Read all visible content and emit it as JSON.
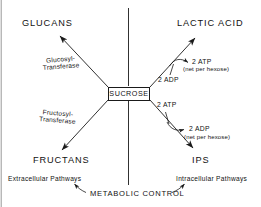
{
  "figure": {
    "hub": {
      "label": "SUCROSE"
    },
    "nodes": [
      {
        "id": "glucans",
        "label": "GLUCANS"
      },
      {
        "id": "lactic-acid",
        "label": "LACTIC  ACID"
      },
      {
        "id": "fructans",
        "label": "FRUCTANS"
      },
      {
        "id": "ips",
        "label": "IPS"
      }
    ],
    "enzymes": [
      {
        "id": "glucosyl-transferase",
        "line1": "Glucosyl-",
        "line2": "Transferase"
      },
      {
        "id": "fructosyl-transferase",
        "line1": "Fructosyl-",
        "line2": "Transferase"
      }
    ],
    "cofactors": [
      {
        "id": "lactic-adp-in",
        "text": "2 ADP"
      },
      {
        "id": "lactic-atp-out",
        "text": "2  ATP"
      },
      {
        "id": "lactic-atp-note",
        "text": "(net per hexose)"
      },
      {
        "id": "ips-atp-in",
        "text": "2  ATP"
      },
      {
        "id": "ips-adp-out",
        "text": "2  ADP"
      },
      {
        "id": "ips-adp-note",
        "text": "(net per hexose)"
      }
    ],
    "pathways": [
      {
        "id": "extracellular",
        "label": "Extracellular  Pathways"
      },
      {
        "id": "intracellular",
        "label": "Intracellular  Pathways"
      }
    ],
    "control": {
      "label": "METABOLIC  CONTROL"
    },
    "colors": {
      "ink": "#111111",
      "line": "#1a1a1a",
      "background": "#ffffff"
    }
  }
}
